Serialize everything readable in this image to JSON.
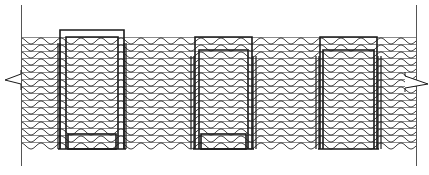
{
  "drawing": {
    "width": 429,
    "height": 175,
    "background": "#ffffff",
    "stroke_color": "#1a1a1a",
    "hatch_line_color": "#8c8c8c",
    "wave_color": "#2a2a2a",
    "wall": {
      "left_edge_x": 21,
      "right_edge_x": 416,
      "edge_top_y": 5,
      "edge_bottom_y": 166,
      "hatch_top_y": 37,
      "hatch_bottom_y": 148,
      "line_spacing": 7,
      "wave_period": 20,
      "wave_amplitude": 3
    },
    "break_lines": [
      {
        "name": "left-break",
        "points": [
          [
            21,
            70
          ],
          [
            21,
            74
          ],
          [
            5,
            80
          ],
          [
            21,
            84
          ],
          [
            21,
            90
          ]
        ]
      },
      {
        "name": "right-break",
        "points": [
          [
            405,
            72
          ],
          [
            405,
            76
          ],
          [
            428,
            84
          ],
          [
            405,
            88
          ],
          [
            405,
            92
          ]
        ]
      }
    ],
    "openings": [
      {
        "name": "opening-1",
        "outer": {
          "x1": 60,
          "y1": 30,
          "x2": 124,
          "y2": 149
        },
        "inner": {
          "x1": 66,
          "y1": 37,
          "x2": 118,
          "y2": 149
        },
        "sill_y": 134,
        "side_jambs": [
          [
            58,
            60
          ],
          [
            124,
            126
          ]
        ]
      },
      {
        "name": "opening-2",
        "outer": {
          "x1": 195,
          "y1": 37,
          "x2": 252,
          "y2": 149
        },
        "inner": {
          "x1": 199,
          "y1": 50,
          "x2": 248,
          "y2": 149
        },
        "sill_y": 134,
        "side_jambs": [
          [
            191,
            194
          ],
          [
            253,
            256
          ]
        ]
      },
      {
        "name": "opening-3",
        "outer": {
          "x1": 320,
          "y1": 37,
          "x2": 377,
          "y2": 149
        },
        "inner": {
          "x1": 323,
          "y1": 50,
          "x2": 374,
          "y2": 149
        },
        "sill_y": null,
        "side_jambs": [
          [
            316,
            319
          ],
          [
            378,
            381
          ]
        ]
      }
    ]
  }
}
